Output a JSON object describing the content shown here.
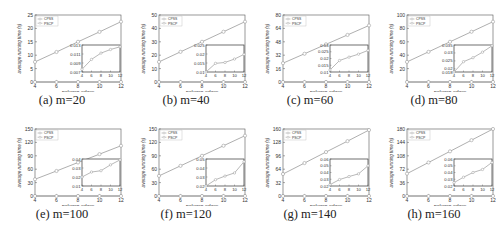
{
  "figure": {
    "xlabel": "polygon edges",
    "ylabel": "average running time (s)",
    "legend": [
      "CPSS",
      "PSCP"
    ]
  },
  "chart_data": [
    {
      "type": "line",
      "caption": "(a) m=20",
      "xlabel": "polygon edges",
      "ylabel": "average running time (s)",
      "x": [
        4,
        6,
        8,
        10,
        12
      ],
      "xlim": [
        4,
        12
      ],
      "ylim": [
        0,
        25
      ],
      "yticks": [
        0,
        5,
        10,
        15,
        20,
        25
      ],
      "series": [
        {
          "name": "CPSS",
          "values": [
            7.5,
            11.2,
            15.0,
            18.7,
            22.5
          ]
        },
        {
          "name": "PSCP",
          "values": [
            0.008,
            0.0095,
            0.0108,
            0.0118,
            0.0125
          ]
        }
      ],
      "inset": {
        "ylim": [
          0.007,
          0.013
        ],
        "yticks": [
          "0.007",
          "0.009",
          "0.011",
          "0.013"
        ],
        "xticks": [
          4,
          6,
          8,
          10,
          12
        ],
        "values": [
          0.0076,
          0.0098,
          0.0112,
          0.012,
          0.0126
        ]
      },
      "legend_position": "upper left"
    },
    {
      "type": "line",
      "caption": "(b) m=40",
      "xlabel": "polygon edges",
      "ylabel": "average running time (s)",
      "x": [
        4,
        6,
        8,
        10,
        12
      ],
      "xlim": [
        4,
        12
      ],
      "ylim": [
        0,
        50
      ],
      "yticks": [
        0,
        10,
        20,
        30,
        40,
        50
      ],
      "series": [
        {
          "name": "CPSS",
          "values": [
            15,
            22.5,
            30,
            37.5,
            45
          ]
        },
        {
          "name": "PSCP",
          "values": [
            0.01,
            0.015,
            0.0155,
            0.017,
            0.02
          ]
        }
      ],
      "inset": {
        "ylim": [
          0.01,
          0.025
        ],
        "yticks": [
          "0.01",
          "0.015",
          "0.02",
          "0.025"
        ],
        "xticks": [
          4,
          6,
          8,
          10,
          12
        ],
        "values": [
          0.01,
          0.0148,
          0.0153,
          0.0172,
          0.0198
        ]
      },
      "legend_position": "upper left"
    },
    {
      "type": "line",
      "caption": "(c) m=60",
      "xlabel": "polygon edges",
      "ylabel": "average running time (s)",
      "x": [
        4,
        6,
        8,
        10,
        12
      ],
      "xlim": [
        4,
        12
      ],
      "ylim": [
        0,
        80
      ],
      "yticks": [
        0,
        16,
        32,
        48,
        64,
        80
      ],
      "series": [
        {
          "name": "CPSS",
          "values": [
            22.5,
            33.7,
            45,
            56.2,
            67.5
          ]
        },
        {
          "name": "PSCP",
          "values": [
            0.012,
            0.018,
            0.021,
            0.023,
            0.026
          ]
        }
      ],
      "inset": {
        "ylim": [
          0.01,
          0.03
        ],
        "yticks": [
          "0.01",
          "0.015",
          "0.02",
          "0.025",
          "0.03"
        ],
        "xticks": [
          4,
          6,
          8,
          10,
          12
        ],
        "values": [
          0.0115,
          0.0185,
          0.021,
          0.0232,
          0.026
        ]
      },
      "legend_position": "upper left"
    },
    {
      "type": "line",
      "caption": "(d) m=80",
      "xlabel": "polygon edges",
      "ylabel": "average running time (s)",
      "x": [
        4,
        6,
        8,
        10,
        12
      ],
      "xlim": [
        4,
        12
      ],
      "ylim": [
        0,
        100
      ],
      "yticks": [
        20,
        40,
        60,
        80,
        100
      ],
      "series": [
        {
          "name": "CPSS",
          "values": [
            30,
            45,
            60,
            75,
            90
          ]
        },
        {
          "name": "PSCP",
          "values": [
            0.018,
            0.024,
            0.027,
            0.031,
            0.034
          ]
        }
      ],
      "inset": {
        "ylim": [
          0.018,
          0.035
        ],
        "yticks": [
          "0.018",
          "0.02",
          "0.025",
          "0.03",
          "0.035"
        ],
        "xticks": [
          4,
          6,
          8,
          10,
          12
        ],
        "values": [
          0.018,
          0.0245,
          0.027,
          0.0305,
          0.0345
        ]
      },
      "legend_position": "upper left"
    },
    {
      "type": "line",
      "caption": "(e) m=100",
      "xlabel": "polygon edges",
      "ylabel": "average running time (s)",
      "x": [
        4,
        6,
        8,
        10,
        12
      ],
      "xlim": [
        4,
        12
      ],
      "ylim": [
        0,
        150
      ],
      "yticks": [
        0,
        30,
        60,
        90,
        120,
        150
      ],
      "series": [
        {
          "name": "CPSS",
          "values": [
            37.5,
            56,
            75,
            93.7,
            112.5
          ]
        },
        {
          "name": "PSCP",
          "values": [
            0.02,
            0.026,
            0.027,
            0.033,
            0.039
          ]
        }
      ],
      "inset": {
        "ylim": [
          0.01,
          0.04
        ],
        "yticks": [
          "0.01",
          "0.02",
          "0.03",
          "0.04"
        ],
        "xticks": [
          4,
          6,
          8,
          10,
          12
        ],
        "values": [
          0.02,
          0.0255,
          0.027,
          0.0335,
          0.039
        ]
      },
      "legend_position": "upper left"
    },
    {
      "type": "line",
      "caption": "(f) m=120",
      "xlabel": "polygon edges",
      "ylabel": "average running time (s)",
      "x": [
        4,
        6,
        8,
        10,
        12
      ],
      "xlim": [
        4,
        12
      ],
      "ylim": [
        0,
        150
      ],
      "yticks": [
        0,
        30,
        60,
        90,
        120,
        150
      ],
      "series": [
        {
          "name": "CPSS",
          "values": [
            45,
            67.5,
            90,
            112.5,
            135
          ]
        },
        {
          "name": "PSCP",
          "values": [
            0.02,
            0.027,
            0.031,
            0.035,
            0.047
          ]
        }
      ],
      "inset": {
        "ylim": [
          0.02,
          0.05
        ],
        "yticks": [
          "0.02",
          "0.03",
          "0.04",
          "0.05"
        ],
        "xticks": [
          4,
          6,
          8,
          10,
          12
        ],
        "values": [
          0.02,
          0.027,
          0.031,
          0.0345,
          0.047
        ]
      },
      "legend_position": "upper left"
    },
    {
      "type": "line",
      "caption": "(g) m=140",
      "xlabel": "polygon edges",
      "ylabel": "average running time (s)",
      "x": [
        4,
        6,
        8,
        10,
        12
      ],
      "xlim": [
        4,
        12
      ],
      "ylim": [
        0,
        160
      ],
      "yticks": [
        0,
        32,
        64,
        96,
        128,
        160
      ],
      "series": [
        {
          "name": "CPSS",
          "values": [
            52.5,
            78.7,
            105,
            131,
            157.5
          ]
        },
        {
          "name": "PSCP",
          "values": [
            0.022,
            0.03,
            0.034,
            0.038,
            0.05
          ]
        }
      ],
      "inset": {
        "ylim": [
          0.02,
          0.06
        ],
        "yticks": [
          "0.02",
          "0.03",
          "0.04",
          "0.05",
          "0.06"
        ],
        "xticks": [
          4,
          6,
          8,
          10,
          12
        ],
        "values": [
          0.022,
          0.0295,
          0.034,
          0.038,
          0.05
        ]
      },
      "legend_position": "upper left"
    },
    {
      "type": "line",
      "caption": "(h) m=160",
      "xlabel": "polygon edges",
      "ylabel": "average running time (s)",
      "x": [
        4,
        6,
        8,
        10,
        12
      ],
      "xlim": [
        4,
        12
      ],
      "ylim": [
        0,
        180
      ],
      "yticks": [
        0,
        36,
        72,
        108,
        144,
        180
      ],
      "series": [
        {
          "name": "CPSS",
          "values": [
            60,
            90,
            120,
            150,
            180
          ]
        },
        {
          "name": "PSCP",
          "values": [
            0.025,
            0.033,
            0.04,
            0.044,
            0.055
          ]
        }
      ],
      "inset": {
        "ylim": [
          0.02,
          0.06
        ],
        "yticks": [
          "0.02",
          "0.03",
          "0.04",
          "0.05",
          "0.06"
        ],
        "xticks": [
          4,
          6,
          8,
          10,
          12
        ],
        "values": [
          0.025,
          0.033,
          0.04,
          0.0445,
          0.055
        ]
      },
      "legend_position": "upper left"
    }
  ]
}
